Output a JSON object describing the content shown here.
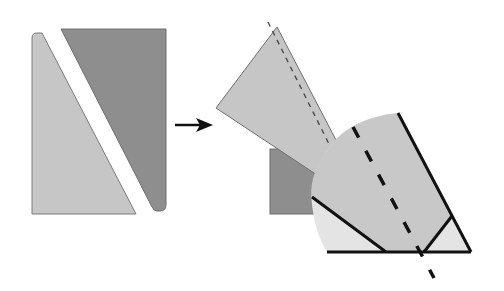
{
  "diagram": {
    "colors": {
      "light_piece": "#c6c6c6",
      "dark_piece": "#8e8e8e",
      "pale_region": "#e4e4e4",
      "outline": "#111111",
      "edge": "#6e6e6e"
    },
    "steps": [
      {
        "name": "before",
        "label": ""
      },
      {
        "name": "after",
        "label": ""
      }
    ],
    "arrow": {
      "direction": "right"
    }
  }
}
